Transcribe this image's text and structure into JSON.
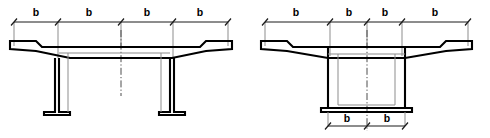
{
  "drawing": {
    "title": "Bridge deck cross-section effective flange width diagrams",
    "background_color": "#ffffff",
    "line_color": "#000000",
    "hidden_line_color": "#8d8d8d",
    "dimension_color": "#1a1a1a",
    "centerline_color": "#4d4d4d"
  },
  "figures": [
    {
      "id": "left-figure",
      "name": "twin-tee-girder-section",
      "description": "Twin T-beam bridge deck cross-section with two stems",
      "top_dimension": {
        "name": "top-dimension-chain",
        "segment_count": 4,
        "labels": [
          "b",
          "b",
          "b",
          "b"
        ]
      },
      "bottom_dimension": null,
      "centerline_label": ""
    },
    {
      "id": "right-figure",
      "name": "box-girder-section",
      "description": "Single-cell box girder bridge deck cross-section",
      "top_dimension": {
        "name": "top-dimension-chain",
        "segment_count": 4,
        "labels": [
          "b",
          "b",
          "b",
          "b"
        ]
      },
      "bottom_dimension": {
        "name": "bottom-dimension-chain",
        "segment_count": 2,
        "labels": [
          "b",
          "b"
        ]
      },
      "centerline_label": ""
    }
  ],
  "labels": {
    "b": "b"
  }
}
